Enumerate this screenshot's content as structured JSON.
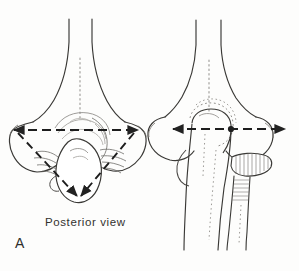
{
  "figure": {
    "panel_label": "A",
    "caption": "Posterior view",
    "background_color": "#fdfdfc",
    "ink_color": "#2b2b2b",
    "faint_ink_color": "#8e8c88"
  },
  "panels": [
    {
      "id": "left-panel",
      "name": "distal-humerus-posterior",
      "label": "A",
      "caption": "Posterior view",
      "measurement_lines": [
        {
          "name": "epicondylar-axis",
          "style": "dashed",
          "arrowheads": "both",
          "x1": 14,
          "y1": 130,
          "x2": 138,
          "y2": 130
        },
        {
          "name": "medial-oblique-axis",
          "style": "dashed",
          "arrowheads": "end",
          "x1": 16,
          "y1": 131,
          "x2": 77,
          "y2": 196
        },
        {
          "name": "lateral-oblique-axis",
          "style": "dashed",
          "arrowheads": "end",
          "x1": 136,
          "y1": 131,
          "x2": 79,
          "y2": 197
        }
      ]
    },
    {
      "id": "right-panel",
      "name": "elbow-joint-anterior",
      "measurement_lines": [
        {
          "name": "epicondylar-axis",
          "style": "dashed",
          "arrowheads": "both",
          "x1": 173,
          "y1": 129,
          "x2": 285,
          "y2": 129,
          "center_marker": {
            "x": 231,
            "y": 129
          }
        }
      ]
    }
  ],
  "anatomy_labels": {
    "left": [
      "humeral-shaft",
      "medial-epicondyle",
      "lateral-epicondyle",
      "olecranon",
      "trochlea"
    ],
    "right": [
      "humeral-shaft",
      "medial-epicondyle",
      "lateral-epicondyle",
      "olecranon",
      "ulna",
      "radius",
      "radial-head"
    ]
  }
}
